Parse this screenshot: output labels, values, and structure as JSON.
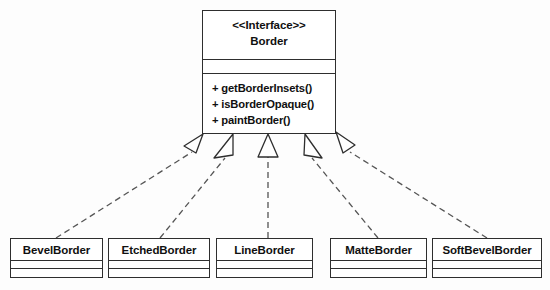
{
  "diagram": {
    "type": "uml-class-diagram",
    "relationship": "realization",
    "line_style": "dashed",
    "arrowhead": "hollow-triangle",
    "colors": {
      "stroke": "#2e2e2e",
      "fill": "#ffffff",
      "text": "#101010",
      "background": "#fdfdfd"
    }
  },
  "interface": {
    "stereotype": "<<Interface>>",
    "name": "Border",
    "attributes": [],
    "operations": [
      "+ getBorderInsets()",
      "+ isBorderOpaque()",
      "+ paintBorder()"
    ]
  },
  "subclasses": [
    {
      "name": "BevelBorder",
      "attributes": [],
      "operations": []
    },
    {
      "name": "EtchedBorder",
      "attributes": [],
      "operations": []
    },
    {
      "name": "LineBorder",
      "attributes": [],
      "operations": []
    },
    {
      "name": "MatteBorder",
      "attributes": [],
      "operations": []
    },
    {
      "name": "SoftBevelBorder",
      "attributes": [],
      "operations": []
    }
  ]
}
